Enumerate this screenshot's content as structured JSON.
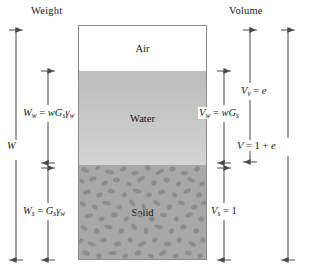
{
  "diagram": {
    "type": "soil-phase-diagram",
    "titles": {
      "left": "Weight",
      "right": "Volume"
    },
    "phases": [
      {
        "key": "air",
        "label": "Air",
        "fill": "#ffffff",
        "texture": "none"
      },
      {
        "key": "water",
        "label": "Water",
        "fill": "#c6c6c6",
        "texture": "none"
      },
      {
        "key": "solid",
        "label": "Solid",
        "fill": "#a8a8a8",
        "texture": "speckled"
      }
    ],
    "weight_dimensions": [
      {
        "name": "water-weight",
        "symbol": "W",
        "subscript": "w",
        "expression": "wGₛγₑ",
        "text": "W_w = wG_sγ_w",
        "spans": [
          "water"
        ]
      },
      {
        "name": "total-weight",
        "symbol": "W",
        "subscript": "",
        "expression": "",
        "text": "W",
        "spans": [
          "air",
          "water",
          "solid"
        ]
      },
      {
        "name": "solid-weight",
        "symbol": "W",
        "subscript": "s",
        "expression": "Gₛγₑ",
        "text": "W_s = G_sγ_w",
        "spans": [
          "solid"
        ]
      }
    ],
    "volume_dimensions": [
      {
        "name": "water-volume",
        "symbol": "V",
        "subscript": "w",
        "expression": "wGₛ",
        "text": "V_w = wG_s",
        "spans": [
          "water"
        ]
      },
      {
        "name": "void-volume",
        "symbol": "V",
        "subscript": "v",
        "expression": "e",
        "text": "V_v = e",
        "spans": [
          "air",
          "water"
        ]
      },
      {
        "name": "total-volume",
        "symbol": "V",
        "subscript": "",
        "expression": "1 + e",
        "text": "V = 1 + e",
        "spans": [
          "air",
          "water",
          "solid"
        ]
      },
      {
        "name": "solid-volume",
        "symbol": "V",
        "subscript": "s",
        "expression": "1",
        "text": "V_s = 1",
        "spans": [
          "solid"
        ]
      }
    ],
    "colors": {
      "line": "#4a4a4a",
      "box_border": "#8a8a8a",
      "air_fill": "#ffffff",
      "water_fill": "#c6c6c6",
      "solid_fill": "#a8a8a8",
      "solid_speckle": "#8d8d8d",
      "text": "#141414"
    }
  }
}
